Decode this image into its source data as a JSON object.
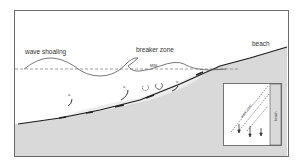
{
  "labels": {
    "wave_shoaling": "wave shoaling",
    "breaker_zone": "breaker zone",
    "beach": "beach",
    "mwl": "MWL",
    "velocity_symbol": "u",
    "inset_wave_crest": "wave crest",
    "inset_beach": "beach"
  },
  "colors": {
    "frame": "#6b6b6b",
    "seabed_fill": "#d9d9d9",
    "seabed_line": "#1a1a1a",
    "water_line": "#555555",
    "mwl_dash": "#777777",
    "text": "#333333"
  }
}
